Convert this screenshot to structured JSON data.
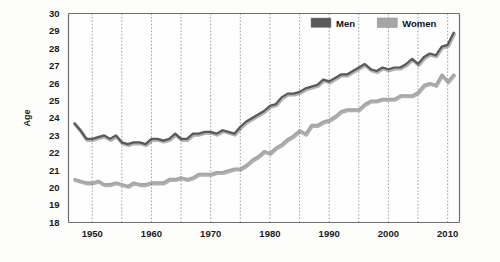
{
  "chart_data": {
    "type": "line",
    "title": "",
    "xlabel": "",
    "ylabel": "Age",
    "xlim": [
      1946,
      2012
    ],
    "ylim": [
      18,
      30
    ],
    "yticks": [
      18,
      19,
      20,
      21,
      22,
      23,
      24,
      25,
      26,
      27,
      28,
      29,
      30
    ],
    "xticks": [
      1950,
      1960,
      1970,
      1980,
      1990,
      2000,
      2010
    ],
    "xtick_labels": [
      "1950",
      "1960",
      "1970",
      "1980",
      "1990",
      "2000",
      "2010"
    ],
    "ytick_labels": [
      "18",
      "19",
      "20",
      "21",
      "22",
      "23",
      "24",
      "25",
      "26",
      "27",
      "28",
      "29",
      "30"
    ],
    "gridlines_x_minor": [
      1950,
      1955,
      1960,
      1965,
      1970,
      1975,
      1980,
      1985,
      1990,
      1995,
      2000,
      2005,
      2010
    ],
    "grid": true,
    "grid_axis": "x",
    "legend_position": "top-right",
    "x": [
      1947,
      1948,
      1949,
      1950,
      1951,
      1952,
      1953,
      1954,
      1955,
      1956,
      1957,
      1958,
      1959,
      1960,
      1961,
      1962,
      1963,
      1964,
      1965,
      1966,
      1967,
      1968,
      1969,
      1970,
      1971,
      1972,
      1973,
      1974,
      1975,
      1976,
      1977,
      1978,
      1979,
      1980,
      1981,
      1982,
      1983,
      1984,
      1985,
      1986,
      1987,
      1988,
      1989,
      1990,
      1991,
      1992,
      1993,
      1994,
      1995,
      1996,
      1997,
      1998,
      1999,
      2000,
      2001,
      2002,
      2003,
      2004,
      2005,
      2006,
      2007,
      2008,
      2009,
      2010,
      2011
    ],
    "series": [
      {
        "name": "Men",
        "color": "#595959",
        "values": [
          23.7,
          23.3,
          22.8,
          22.8,
          22.9,
          23.0,
          22.8,
          23.0,
          22.6,
          22.5,
          22.6,
          22.6,
          22.5,
          22.8,
          22.8,
          22.7,
          22.8,
          23.1,
          22.8,
          22.8,
          23.1,
          23.1,
          23.2,
          23.2,
          23.1,
          23.3,
          23.2,
          23.1,
          23.5,
          23.8,
          24.0,
          24.2,
          24.4,
          24.7,
          24.8,
          25.2,
          25.4,
          25.4,
          25.5,
          25.7,
          25.8,
          25.9,
          26.2,
          26.1,
          26.3,
          26.5,
          26.5,
          26.7,
          26.9,
          27.1,
          26.8,
          26.7,
          26.9,
          26.8,
          26.9,
          26.9,
          27.1,
          27.4,
          27.1,
          27.5,
          27.7,
          27.6,
          28.1,
          28.2,
          28.9
        ]
      },
      {
        "name": "Women",
        "color": "#a6a6a6",
        "values": [
          20.5,
          20.4,
          20.3,
          20.3,
          20.4,
          20.2,
          20.2,
          20.3,
          20.2,
          20.1,
          20.3,
          20.2,
          20.2,
          20.3,
          20.3,
          20.3,
          20.5,
          20.5,
          20.6,
          20.5,
          20.6,
          20.8,
          20.8,
          20.8,
          20.9,
          20.9,
          21.0,
          21.1,
          21.1,
          21.3,
          21.6,
          21.8,
          22.1,
          22.0,
          22.3,
          22.5,
          22.8,
          23.0,
          23.3,
          23.1,
          23.6,
          23.6,
          23.8,
          23.9,
          24.1,
          24.4,
          24.5,
          24.5,
          24.5,
          24.8,
          25.0,
          25.0,
          25.1,
          25.1,
          25.1,
          25.3,
          25.3,
          25.3,
          25.5,
          25.9,
          26.0,
          25.9,
          26.5,
          26.1,
          26.5
        ]
      }
    ],
    "legend": [
      {
        "label": "Men",
        "color": "#595959"
      },
      {
        "label": "Women",
        "color": "#a6a6a6"
      }
    ]
  }
}
